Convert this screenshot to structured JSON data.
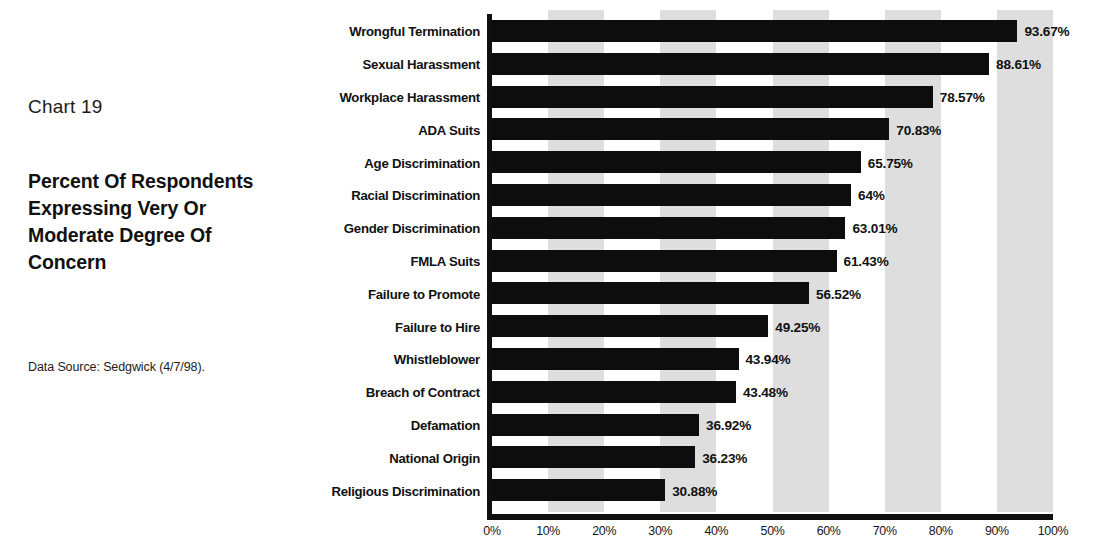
{
  "caption": {
    "chart_number": "Chart 19",
    "title": "Percent Of Respondents Expressing Very Or Moderate Degree Of Concern",
    "data_source": "Data Source: Sedgwick (4/7/98)."
  },
  "chart_data": {
    "type": "bar",
    "orientation": "horizontal",
    "title": "Percent Of Respondents Expressing Very Or Moderate Degree Of Concern",
    "subtitle": "Chart 19",
    "xlabel": "",
    "ylabel": "",
    "xlim": [
      0,
      100
    ],
    "grid": "alternating vertical shaded bands every 10% starting at 10%",
    "legend": "none",
    "source_note": "Data Source: Sedgwick (4/7/98).",
    "categories": [
      "Wrongful Termination",
      "Sexual Harassment",
      "Workplace Harassment",
      "ADA Suits",
      "Age Discrimination",
      "Racial Discrimination",
      "Gender Discrimination",
      "FMLA Suits",
      "Failure to Promote",
      "Failure to Hire",
      "Whistleblower",
      "Breach of Contract",
      "Defamation",
      "National Origin",
      "Religious Discrimination"
    ],
    "values": [
      93.67,
      88.61,
      78.57,
      70.83,
      65.75,
      64,
      63.01,
      61.43,
      56.52,
      49.25,
      43.94,
      43.48,
      36.92,
      36.23,
      30.88
    ],
    "value_labels": [
      "93.67%",
      "88.61%",
      "78.57%",
      "70.83%",
      "65.75%",
      "64%",
      "63.01%",
      "61.43%",
      "56.52%",
      "49.25%",
      "43.94%",
      "43.48%",
      "36.92%",
      "36.23%",
      "30.88%"
    ],
    "tick_values": [
      0,
      10,
      20,
      30,
      40,
      50,
      60,
      70,
      80,
      90,
      100
    ],
    "tick_labels": [
      "0%",
      "10%",
      "20%",
      "30%",
      "40%",
      "50%",
      "60%",
      "70%",
      "80%",
      "90%",
      "100%"
    ],
    "band_ranges": [
      [
        10,
        20
      ],
      [
        30,
        40
      ],
      [
        50,
        60
      ],
      [
        70,
        80
      ],
      [
        90,
        100
      ]
    ],
    "colors": {
      "bar": "#0d0d0d",
      "band": "#dedede",
      "axis": "#101010",
      "background": "#ffffff",
      "text": "#111111"
    }
  }
}
